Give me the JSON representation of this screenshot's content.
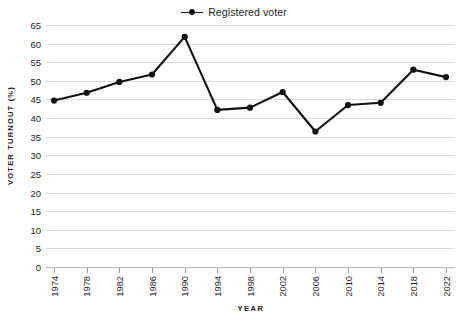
{
  "chart_data": {
    "type": "line",
    "title": "",
    "xlabel": "YEAR",
    "ylabel": "VOTER TURNOUT (%)",
    "legend_position": "top-center",
    "grid": true,
    "ylim": [
      0,
      65
    ],
    "yticks": [
      0,
      5,
      10,
      15,
      20,
      25,
      30,
      35,
      40,
      45,
      50,
      55,
      60,
      65
    ],
    "ytick_labels": [
      "0",
      "5",
      "10",
      "15",
      "20",
      "25",
      "30",
      "35",
      "40",
      "45",
      "50",
      "55",
      "60",
      "65"
    ],
    "categories": [
      "1974",
      "1978",
      "1982",
      "1986",
      "1990",
      "1994",
      "1998",
      "2002",
      "2006",
      "2010",
      "2014",
      "2018",
      "2022"
    ],
    "series": [
      {
        "name": "Registered voter",
        "color": "#111111",
        "marker": "circle",
        "values": [
          44.7,
          46.8,
          49.7,
          51.7,
          61.8,
          42.2,
          42.8,
          47.0,
          36.4,
          43.5,
          44.1,
          53.0,
          51.0
        ]
      }
    ]
  },
  "legend": {
    "entries": [
      {
        "label": "Registered voter"
      }
    ]
  },
  "axes": {
    "x_title": "YEAR",
    "y_title": "VOTER TURNOUT (%)"
  }
}
